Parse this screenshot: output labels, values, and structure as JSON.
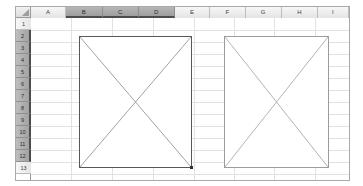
{
  "app": {
    "type": "spreadsheet-grid",
    "background_color": "#ffffff",
    "frame_border_color": "#a9a9a9"
  },
  "corner": {
    "name": "select-all",
    "icon": "select-all-triangle-icon"
  },
  "columns": {
    "headers": [
      {
        "label": "A",
        "selected": false,
        "x": 0,
        "width": 40
      },
      {
        "label": "B",
        "selected": true,
        "x": 40,
        "width": 41
      },
      {
        "label": "C",
        "selected": true,
        "x": 81,
        "width": 41
      },
      {
        "label": "D",
        "selected": true,
        "x": 122,
        "width": 41
      },
      {
        "label": "E",
        "selected": false,
        "x": 163,
        "width": 40
      },
      {
        "label": "F",
        "selected": false,
        "x": 203,
        "width": 40
      },
      {
        "label": "G",
        "selected": false,
        "x": 243,
        "width": 41
      },
      {
        "label": "H",
        "selected": false,
        "x": 284,
        "width": 41
      },
      {
        "label": "I",
        "selected": false,
        "x": 325,
        "width": 35
      }
    ],
    "selected_range": "B:D",
    "selected_header_bg": "#a6a6a6",
    "header_bg": "#eeeeee"
  },
  "rows": {
    "headers": [
      {
        "label": "1",
        "selected": false,
        "height": 12
      },
      {
        "label": "2",
        "selected": true,
        "height": 12
      },
      {
        "label": "3",
        "selected": true,
        "height": 12
      },
      {
        "label": "4",
        "selected": true,
        "height": 12
      },
      {
        "label": "5",
        "selected": true,
        "height": 12
      },
      {
        "label": "6",
        "selected": true,
        "height": 12
      },
      {
        "label": "7",
        "selected": true,
        "height": 12
      },
      {
        "label": "8",
        "selected": true,
        "height": 12
      },
      {
        "label": "9",
        "selected": true,
        "height": 12
      },
      {
        "label": "10",
        "selected": true,
        "height": 12
      },
      {
        "label": "11",
        "selected": true,
        "height": 12
      },
      {
        "label": "12",
        "selected": true,
        "height": 12
      },
      {
        "label": "13",
        "selected": false,
        "height": 12
      }
    ],
    "selected_range": "2:12"
  },
  "shapes": [
    {
      "name": "image-placeholder-left",
      "kind": "crossed-box-placeholder",
      "selected": true,
      "anchor_range": "B2:D12",
      "left": 48,
      "top": 18,
      "width": 113,
      "height": 132,
      "border_color": "#585858",
      "diagonal_color": "#8a8a8a",
      "fill": "#ffffff",
      "handle": {
        "name": "resize-handle-bottom-right",
        "color": "#2e2e2e",
        "size": 3
      }
    },
    {
      "name": "image-placeholder-right",
      "kind": "crossed-box-placeholder",
      "selected": false,
      "anchor_range": "F2:H12",
      "left": 193,
      "top": 18,
      "width": 105,
      "height": 132,
      "border_color": "#9c9c9c",
      "diagonal_color": "#a0a0a0",
      "fill": "#ffffff",
      "handle": null
    }
  ],
  "grid": {
    "line_color": "#e2e2e2",
    "row_height": 12,
    "column_x_positions": [
      0,
      40,
      81,
      122,
      163,
      203,
      243,
      284,
      325
    ],
    "row_y_positions": [
      0,
      12,
      24,
      36,
      48,
      60,
      72,
      84,
      96,
      108,
      120,
      132,
      144,
      156
    ]
  }
}
